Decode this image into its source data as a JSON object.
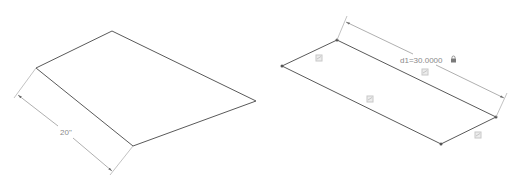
{
  "left_figure": {
    "dimension_label": "20\"",
    "vertices": {
      "top": [
        112,
        31
      ],
      "left": [
        36,
        68
      ],
      "bottom": [
        133,
        146
      ],
      "right": [
        256,
        101
      ]
    }
  },
  "right_figure": {
    "dimension_label": "d1=30.0000",
    "lock_icon": "lock-icon",
    "vertices": {
      "left": [
        282,
        66
      ],
      "top": [
        337,
        40
      ],
      "right": [
        496,
        117
      ],
      "bottom": [
        441,
        144
      ]
    },
    "constraint_icons": [
      "parallel-constraint-icon",
      "parallel-constraint-icon",
      "parallel-constraint-icon",
      "parallel-constraint-icon"
    ]
  },
  "colors": {
    "edge": "#5a5a5a",
    "dimension": "#9a9a9a",
    "text": "#8a8a8a"
  }
}
